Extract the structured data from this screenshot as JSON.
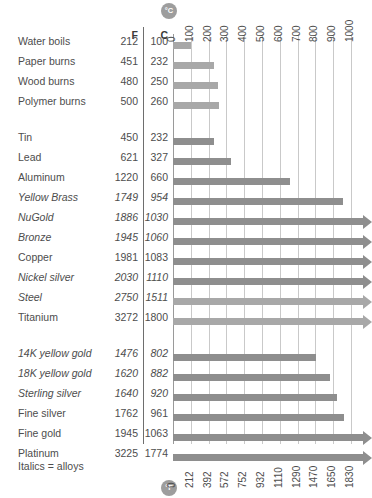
{
  "chart_data": {
    "type": "bar",
    "title": "",
    "xlabel_top": "°C",
    "xlabel_bottom": "°F",
    "orientation": "horizontal",
    "grid": true,
    "legend": "Italics = alloys",
    "xlim_c": [
      0,
      1000
    ],
    "xlim_f": [
      0,
      1830
    ],
    "axis_top_unit": "C",
    "axis_bottom_unit": "F",
    "axis_top_ticks": [
      0,
      100,
      200,
      300,
      400,
      500,
      600,
      700,
      800,
      900,
      1000
    ],
    "axis_bottom_ticks": [
      0,
      212,
      392,
      572,
      752,
      932,
      1110,
      1290,
      1470,
      1650,
      1830
    ],
    "columns": [
      "F",
      "C"
    ],
    "categories": [
      "Water boils",
      "Paper burns",
      "Wood burns",
      "Polymer burns",
      "Tin",
      "Lead",
      "Aluminum",
      "Yellow Brass",
      "NuGold",
      "Bronze",
      "Copper",
      "Nickel silver",
      "Steel",
      "Titanium",
      "14K yellow gold",
      "18K yellow gold",
      "Sterling silver",
      "Fine silver",
      "Fine gold",
      "Platinum"
    ],
    "series": [
      {
        "name": "F",
        "values": [
          212,
          451,
          480,
          500,
          450,
          621,
          1220,
          1749,
          1886,
          1945,
          1981,
          2030,
          2750,
          3272,
          1476,
          1620,
          1640,
          1762,
          1945,
          3225
        ]
      },
      {
        "name": "C",
        "values": [
          100,
          232,
          250,
          260,
          232,
          327,
          660,
          954,
          1030,
          1060,
          1083,
          1110,
          1511,
          1800,
          802,
          882,
          920,
          961,
          1063,
          1774
        ]
      }
    ]
  },
  "rows": [
    {
      "label": "Water boils",
      "f": "212",
      "c": "100",
      "c_value": 100,
      "italic": false,
      "group": 0,
      "clipped": false,
      "light": true
    },
    {
      "label": "Paper burns",
      "f": "451",
      "c": "232",
      "c_value": 232,
      "italic": false,
      "group": 0,
      "clipped": false,
      "light": true
    },
    {
      "label": "Wood burns",
      "f": "480",
      "c": "250",
      "c_value": 250,
      "italic": false,
      "group": 0,
      "clipped": false,
      "light": true
    },
    {
      "label": "Polymer burns",
      "f": "500",
      "c": "260",
      "c_value": 260,
      "italic": false,
      "group": 0,
      "clipped": false,
      "light": true
    },
    {
      "label": "Tin",
      "f": "450",
      "c": "232",
      "c_value": 232,
      "italic": false,
      "group": 1,
      "clipped": false,
      "light": false
    },
    {
      "label": "Lead",
      "f": "621",
      "c": "327",
      "c_value": 327,
      "italic": false,
      "group": 1,
      "clipped": false,
      "light": false
    },
    {
      "label": "Aluminum",
      "f": "1220",
      "c": "660",
      "c_value": 660,
      "italic": false,
      "group": 1,
      "clipped": false,
      "light": false
    },
    {
      "label": "Yellow Brass",
      "f": "1749",
      "c": "954",
      "c_value": 954,
      "italic": true,
      "group": 1,
      "clipped": false,
      "light": false
    },
    {
      "label": "NuGold",
      "f": "1886",
      "c": "1030",
      "c_value": 1030,
      "italic": true,
      "group": 1,
      "clipped": false,
      "light": false
    },
    {
      "label": "Bronze",
      "f": "1945",
      "c": "1060",
      "c_value": 1060,
      "italic": true,
      "group": 1,
      "clipped": true,
      "light": false
    },
    {
      "label": "Copper",
      "f": "1981",
      "c": "1083",
      "c_value": 1083,
      "italic": false,
      "group": 1,
      "clipped": true,
      "light": false
    },
    {
      "label": "Nickel silver",
      "f": "2030",
      "c": "1110",
      "c_value": 1110,
      "italic": true,
      "group": 1,
      "clipped": true,
      "light": false
    },
    {
      "label": "Steel",
      "f": "2750",
      "c": "1511",
      "c_value": 1511,
      "italic": true,
      "group": 1,
      "clipped": false,
      "light": true
    },
    {
      "label": "Titanium",
      "f": "3272",
      "c": "1800",
      "c_value": 1800,
      "italic": false,
      "group": 1,
      "clipped": false,
      "light": true
    },
    {
      "label": "14K yellow gold",
      "f": "1476",
      "c": "802",
      "c_value": 802,
      "italic": true,
      "group": 2,
      "clipped": false,
      "light": false
    },
    {
      "label": "18K yellow gold",
      "f": "1620",
      "c": "882",
      "c_value": 882,
      "italic": true,
      "group": 2,
      "clipped": false,
      "light": false
    },
    {
      "label": "Sterling silver",
      "f": "1640",
      "c": "920",
      "c_value": 920,
      "italic": true,
      "group": 2,
      "clipped": false,
      "light": false
    },
    {
      "label": "Fine silver",
      "f": "1762",
      "c": "961",
      "c_value": 961,
      "italic": false,
      "group": 2,
      "clipped": false,
      "light": false
    },
    {
      "label": "Fine gold",
      "f": "1945",
      "c": "1063",
      "c_value": 1063,
      "italic": false,
      "group": 2,
      "clipped": false,
      "light": false
    },
    {
      "label": "Platinum",
      "f": "3225",
      "c": "1774",
      "c_value": 1774,
      "italic": false,
      "group": 2,
      "clipped": true,
      "light": false
    }
  ],
  "headers": {
    "f": "F",
    "c": "C"
  },
  "badges": {
    "celsius": "°C",
    "fahrenheit": "°F"
  },
  "footnote": "Italics = alloys",
  "colors": {
    "bar": "#8e8e8e",
    "bar_light": "#a8a8a8",
    "grid": "#c9c9c9",
    "text": "#4d4d4d"
  }
}
